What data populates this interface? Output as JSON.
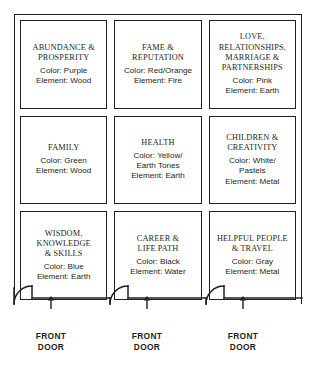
{
  "diagram": {
    "line_color": "#231f20",
    "background_color": "#ffffff"
  },
  "cells": [
    {
      "id": "abundance-prosperity",
      "title": "ABUNDANCE &\nPROSPERITY",
      "color_line": "Color: Purple",
      "element_line": "Element: Wood",
      "color": "Purple",
      "element": "Wood",
      "row": 1,
      "col": 1
    },
    {
      "id": "fame-reputation",
      "title": "FAME &\nREPUTATION",
      "color_line": "Color: Red/Orange",
      "element_line": "Element: Fire",
      "color": "Red/Orange",
      "element": "Fire",
      "row": 1,
      "col": 2
    },
    {
      "id": "love-relationships-marriage-partnerships",
      "title": "LOVE,\nRELATIONSHIPS,\nMARRIAGE &\nPARTNERSHIPS",
      "color_line": "Color: Pink",
      "element_line": "Element: Earth",
      "color": "Pink",
      "element": "Earth",
      "row": 1,
      "col": 3
    },
    {
      "id": "family",
      "title": "FAMILY",
      "color_line": "Color: Green",
      "element_line": "Element: Wood",
      "color": "Green",
      "element": "Wood",
      "row": 2,
      "col": 1
    },
    {
      "id": "health",
      "title": "HEALTH",
      "color_line": "Color: Yellow/\nEarth Tones",
      "element_line": "Element: Earth",
      "color": "Yellow/Earth Tones",
      "element": "Earth",
      "row": 2,
      "col": 2
    },
    {
      "id": "children-creativity",
      "title": "CHILDREN &\nCREATIVITY",
      "color_line": "Color: White/\nPastels",
      "element_line": "Element: Metal",
      "color": "White/Pastels",
      "element": "Metal",
      "row": 2,
      "col": 3
    },
    {
      "id": "wisdom-knowledge-skills",
      "title": "WISDOM,\nKNOWLEDGE\n& SKILLS",
      "color_line": "Color: Blue",
      "element_line": "Element: Earth",
      "color": "Blue",
      "element": "Earth",
      "row": 3,
      "col": 1
    },
    {
      "id": "career-life-path",
      "title": "CAREER &\nLIFE PATH",
      "color_line": "Color: Black",
      "element_line": "Element: Water",
      "color": "Black",
      "element": "Water",
      "row": 3,
      "col": 2
    },
    {
      "id": "helpful-people-travel",
      "title": "HELPFUL PEOPLE\n& TRAVEL",
      "color_line": "Color: Gray",
      "element_line": "Element: Metal",
      "color": "Gray",
      "element": "Metal",
      "row": 3,
      "col": 3
    }
  ],
  "doors": [
    {
      "id": "front-door-1",
      "label": "FRONT\nDOOR"
    },
    {
      "id": "front-door-2",
      "label": "FRONT\nDOOR"
    },
    {
      "id": "front-door-3",
      "label": "FRONT\nDOOR"
    }
  ]
}
